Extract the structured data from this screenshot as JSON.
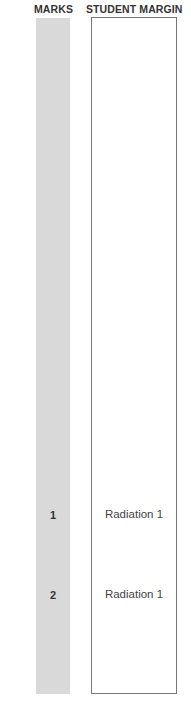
{
  "headers": {
    "marks": "MARKS",
    "student_margin": "STUDENT MARGIN"
  },
  "rows": [
    {
      "mark": "1",
      "note": "Radiation 1"
    },
    {
      "mark": "2",
      "note": "Radiation 1"
    }
  ],
  "colors": {
    "marks_column": "#d9d9d9",
    "margin_border": "#777777"
  }
}
